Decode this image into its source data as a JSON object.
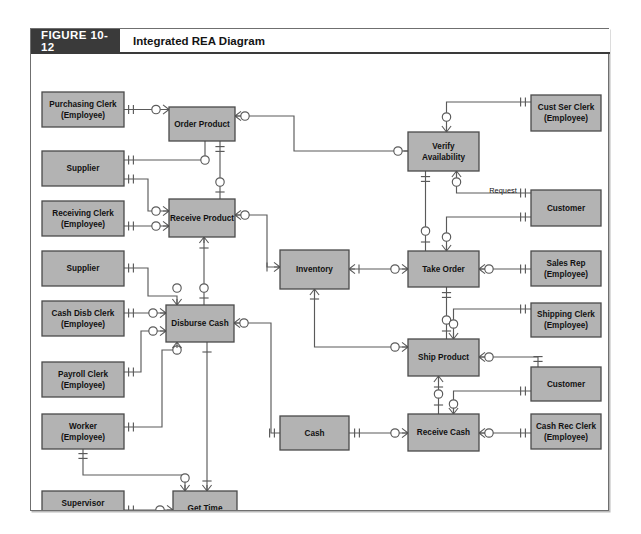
{
  "figure": {
    "number": "FIGURE 10-12",
    "title": "Integrated REA Diagram"
  },
  "colors": {
    "header_bg": "#3a3a3a",
    "header_text": "#ffffff",
    "entity_fill": "#b3b3b3",
    "entity_stroke": "#4a4a4a",
    "line": "#5a5a5a",
    "page_bg": "#ffffff"
  },
  "annotations": [
    {
      "id": "request-label",
      "text": "Request",
      "x": 472,
      "y": 139
    }
  ],
  "entities": [
    {
      "id": "purchasing-clerk",
      "kind": "agent",
      "line1": "Purchasing Clerk",
      "line2": "(Employee)",
      "x": 11,
      "y": 38,
      "w": 82,
      "h": 35
    },
    {
      "id": "supplier-1",
      "kind": "agent",
      "line1": "Supplier",
      "line2": "",
      "x": 11,
      "y": 97,
      "w": 82,
      "h": 35
    },
    {
      "id": "receiving-clerk",
      "kind": "agent",
      "line1": "Receiving Clerk",
      "line2": "(Employee)",
      "x": 11,
      "y": 147,
      "w": 82,
      "h": 35
    },
    {
      "id": "supplier-2",
      "kind": "agent",
      "line1": "Supplier",
      "line2": "",
      "x": 11,
      "y": 197,
      "w": 82,
      "h": 35
    },
    {
      "id": "cash-disb-clerk",
      "kind": "agent",
      "line1": "Cash Disb Clerk",
      "line2": "(Employee)",
      "x": 11,
      "y": 247,
      "w": 82,
      "h": 35
    },
    {
      "id": "payroll-clerk",
      "kind": "agent",
      "line1": "Payroll Clerk",
      "line2": "(Employee)",
      "x": 11,
      "y": 308,
      "w": 82,
      "h": 35
    },
    {
      "id": "worker",
      "kind": "agent",
      "line1": "Worker",
      "line2": "(Employee)",
      "x": 11,
      "y": 360,
      "w": 82,
      "h": 35
    },
    {
      "id": "supervisor",
      "kind": "agent",
      "line1": "Supervisor",
      "line2": "(Employee)",
      "x": 11,
      "y": 437,
      "w": 82,
      "h": 35
    },
    {
      "id": "order-product",
      "kind": "event",
      "line1": "Order Product",
      "line2": "",
      "x": 138,
      "y": 53,
      "w": 66,
      "h": 34
    },
    {
      "id": "receive-product",
      "kind": "event",
      "line1": "Receive Product",
      "line2": "",
      "x": 138,
      "y": 145,
      "w": 66,
      "h": 38
    },
    {
      "id": "disburse-cash",
      "kind": "event",
      "line1": "Disburse Cash",
      "line2": "",
      "x": 135,
      "y": 251,
      "w": 68,
      "h": 37
    },
    {
      "id": "get-time",
      "kind": "event",
      "line1": "Get Time",
      "line2": "",
      "x": 142,
      "y": 437,
      "w": 64,
      "h": 35
    },
    {
      "id": "inventory",
      "kind": "resource",
      "line1": "Inventory",
      "line2": "",
      "x": 249,
      "y": 196,
      "w": 69,
      "h": 39
    },
    {
      "id": "cash",
      "kind": "resource",
      "line1": "Cash",
      "line2": "",
      "x": 249,
      "y": 362,
      "w": 69,
      "h": 34
    },
    {
      "id": "verify-availability",
      "kind": "event",
      "line1": "Verify",
      "line2": "Availability",
      "x": 377,
      "y": 78,
      "w": 71,
      "h": 39
    },
    {
      "id": "take-order",
      "kind": "event",
      "line1": "Take Order",
      "line2": "",
      "x": 377,
      "y": 197,
      "w": 71,
      "h": 36
    },
    {
      "id": "ship-product",
      "kind": "event",
      "line1": "Ship Product",
      "line2": "",
      "x": 377,
      "y": 285,
      "w": 71,
      "h": 37
    },
    {
      "id": "receive-cash",
      "kind": "event",
      "line1": "Receive Cash",
      "line2": "",
      "x": 377,
      "y": 360,
      "w": 71,
      "h": 37
    },
    {
      "id": "cust-ser-clerk",
      "kind": "agent",
      "line1": "Cust Ser Clerk",
      "line2": "(Employee)",
      "x": 500,
      "y": 41,
      "w": 70,
      "h": 36
    },
    {
      "id": "customer-1",
      "kind": "agent",
      "line1": "Customer",
      "line2": "",
      "x": 500,
      "y": 136,
      "w": 70,
      "h": 36
    },
    {
      "id": "sales-rep",
      "kind": "agent",
      "line1": "Sales Rep",
      "line2": "(Employee)",
      "x": 500,
      "y": 197,
      "w": 70,
      "h": 35
    },
    {
      "id": "shipping-clerk",
      "kind": "agent",
      "line1": "Shipping Clerk",
      "line2": "(Employee)",
      "x": 500,
      "y": 249,
      "w": 70,
      "h": 34
    },
    {
      "id": "customer-2",
      "kind": "agent",
      "line1": "Customer",
      "line2": "",
      "x": 500,
      "y": 313,
      "w": 70,
      "h": 34
    },
    {
      "id": "cash-rec-clerk",
      "kind": "agent",
      "line1": "Cash Rec Clerk",
      "line2": "(Employee)",
      "x": 500,
      "y": 360,
      "w": 70,
      "h": 35
    }
  ],
  "relationships": [
    {
      "id": "purchasing-clerk--order-product",
      "from": "purchasing-clerk",
      "to": "order-product"
    },
    {
      "id": "supplier-1--order-product",
      "from": "supplier-1",
      "to": "order-product"
    },
    {
      "id": "order-product--receive-product",
      "from": "order-product",
      "to": "receive-product"
    },
    {
      "id": "supplier-1--receive-product",
      "from": "supplier-1",
      "to": "receive-product"
    },
    {
      "id": "receiving-clerk--receive-product",
      "from": "receiving-clerk",
      "to": "receive-product"
    },
    {
      "id": "receive-product--inventory",
      "from": "receive-product",
      "to": "inventory"
    },
    {
      "id": "receive-product--disburse-cash",
      "from": "receive-product",
      "to": "disburse-cash"
    },
    {
      "id": "supplier-2--disburse-cash",
      "from": "supplier-2",
      "to": "disburse-cash"
    },
    {
      "id": "cash-disb-clerk--disburse-cash",
      "from": "cash-disb-clerk",
      "to": "disburse-cash"
    },
    {
      "id": "payroll-clerk--disburse-cash",
      "from": "payroll-clerk",
      "to": "disburse-cash"
    },
    {
      "id": "worker--disburse-cash",
      "from": "worker",
      "to": "disburse-cash"
    },
    {
      "id": "disburse-cash--cash",
      "from": "disburse-cash",
      "to": "cash"
    },
    {
      "id": "disburse-cash--get-time",
      "from": "disburse-cash",
      "to": "get-time"
    },
    {
      "id": "worker--get-time",
      "from": "worker",
      "to": "get-time"
    },
    {
      "id": "supervisor--get-time",
      "from": "supervisor",
      "to": "get-time"
    },
    {
      "id": "order-product--verify-availability",
      "from": "order-product",
      "to": "verify-availability"
    },
    {
      "id": "cust-ser-clerk--verify-availability",
      "from": "cust-ser-clerk",
      "to": "verify-availability"
    },
    {
      "id": "verify-availability--customer-1",
      "from": "verify-availability",
      "to": "customer-1"
    },
    {
      "id": "verify-availability--take-order",
      "from": "verify-availability",
      "to": "take-order"
    },
    {
      "id": "inventory--take-order",
      "from": "inventory",
      "to": "take-order"
    },
    {
      "id": "customer-1--take-order",
      "from": "customer-1",
      "to": "take-order"
    },
    {
      "id": "sales-rep--take-order",
      "from": "sales-rep",
      "to": "take-order"
    },
    {
      "id": "take-order--ship-product",
      "from": "take-order",
      "to": "ship-product"
    },
    {
      "id": "inventory--ship-product",
      "from": "inventory",
      "to": "ship-product"
    },
    {
      "id": "shipping-clerk--ship-product",
      "from": "shipping-clerk",
      "to": "ship-product"
    },
    {
      "id": "ship-product--customer-2",
      "from": "ship-product",
      "to": "customer-2"
    },
    {
      "id": "ship-product--receive-cash",
      "from": "ship-product",
      "to": "receive-cash"
    },
    {
      "id": "cash--receive-cash",
      "from": "cash",
      "to": "receive-cash"
    },
    {
      "id": "customer-2--receive-cash",
      "from": "customer-2",
      "to": "receive-cash"
    },
    {
      "id": "cash-rec-clerk--receive-cash",
      "from": "cash-rec-clerk",
      "to": "receive-cash"
    }
  ]
}
